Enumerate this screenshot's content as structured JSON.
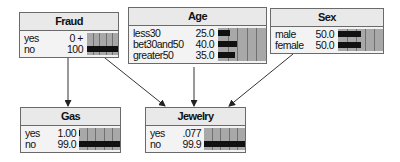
{
  "network": {
    "nodes": [
      {
        "id": "fraud",
        "title": "Fraud",
        "x": 19,
        "y": 12,
        "w": 100,
        "val_right": 65,
        "bar_left": 67,
        "states": [
          {
            "label": "yes",
            "value": "0 +",
            "pct": 0
          },
          {
            "label": "no",
            "value": "100",
            "pct": 100
          }
        ]
      },
      {
        "id": "age",
        "title": "Age",
        "x": 128,
        "y": 7,
        "w": 139,
        "val_right": 87,
        "bar_left": 89,
        "states": [
          {
            "label": "less30",
            "value": "25.0",
            "pct": 25
          },
          {
            "label": "bet30and50",
            "value": "40.0",
            "pct": 40
          },
          {
            "label": "greater50",
            "value": "35.0",
            "pct": 35
          }
        ]
      },
      {
        "id": "sex",
        "title": "Sex",
        "x": 270,
        "y": 8,
        "w": 114,
        "val_right": 65,
        "bar_left": 67,
        "states": [
          {
            "label": "male",
            "value": "50.0",
            "pct": 50
          },
          {
            "label": "female",
            "value": "50.0",
            "pct": 50
          }
        ]
      },
      {
        "id": "gas",
        "title": "Gas",
        "x": 20,
        "y": 107,
        "w": 101,
        "val_right": 57,
        "bar_left": 58,
        "states": [
          {
            "label": "yes",
            "value": "1.00",
            "pct": 1
          },
          {
            "label": "no",
            "value": "99.0",
            "pct": 99
          }
        ]
      },
      {
        "id": "jewelry",
        "title": "Jewelry",
        "x": 145,
        "y": 107,
        "w": 101,
        "val_right": 57,
        "bar_left": 58,
        "states": [
          {
            "label": "yes",
            "value": ".077",
            "pct": 0.077
          },
          {
            "label": "no",
            "value": "99.9",
            "pct": 99.9
          }
        ]
      }
    ],
    "edges": [
      {
        "from": "fraud",
        "to": "gas"
      },
      {
        "from": "fraud",
        "to": "jewelry"
      },
      {
        "from": "age",
        "to": "jewelry"
      },
      {
        "from": "sex",
        "to": "jewelry"
      }
    ],
    "colors": {
      "bar": "#111111",
      "bar_bg": "#a8a8a8",
      "title_bg": "#e9e9e9",
      "border": "#6a6a6a",
      "edge": "#333333"
    }
  }
}
